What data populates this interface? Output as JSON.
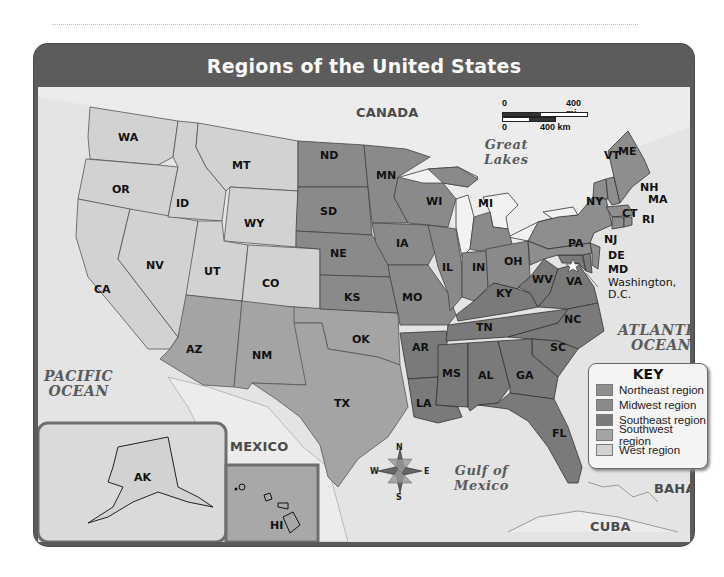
{
  "title": "Regions of the United States",
  "regions": {
    "northeast": {
      "label": "Northeast region",
      "color": "#8e8e8e",
      "states": [
        "ME",
        "VT",
        "NH",
        "MA",
        "RI",
        "CT",
        "NY",
        "PA",
        "NJ"
      ]
    },
    "midwest": {
      "label": "Midwest region",
      "color": "#8a8a8a",
      "states": [
        "ND",
        "SD",
        "NE",
        "KS",
        "MN",
        "IA",
        "MO",
        "WI",
        "IL",
        "MI",
        "IN",
        "OH"
      ]
    },
    "southeast": {
      "label": "Southeast region",
      "color": "#7a7a7a",
      "states": [
        "AR",
        "LA",
        "MS",
        "AL",
        "TN",
        "KY",
        "WV",
        "VA",
        "NC",
        "SC",
        "GA",
        "FL",
        "DE",
        "MD"
      ]
    },
    "southwest": {
      "label": "Southwest region",
      "color": "#a4a4a4",
      "states": [
        "AZ",
        "NM",
        "OK",
        "TX"
      ]
    },
    "west": {
      "label": "West region",
      "color": "#d2d2d2",
      "states": [
        "WA",
        "OR",
        "CA",
        "NV",
        "ID",
        "MT",
        "WY",
        "UT",
        "CO",
        "AK",
        "HI"
      ]
    }
  },
  "key": {
    "title": "KEY",
    "items": [
      {
        "label": "Northeast region",
        "color": "#8e8e8e"
      },
      {
        "label": "Midwest region",
        "color": "#8a8a8a"
      },
      {
        "label": "Southeast region",
        "color": "#7a7a7a"
      },
      {
        "label": "Southwest region",
        "color": "#a4a4a4"
      },
      {
        "label": "West region",
        "color": "#d2d2d2"
      }
    ]
  },
  "scale_bar": {
    "miles_zero": "0",
    "miles_label": "400 mi",
    "km_zero": "0",
    "km_label": "400 km"
  },
  "compass": {
    "n": "N",
    "s": "S",
    "e": "E",
    "w": "W"
  },
  "water_labels": {
    "pacific": "PACIFIC OCEAN",
    "pacific_line1": "PACIFIC",
    "pacific_line2": "OCEAN",
    "atlantic_line1": "ATLANTIC",
    "atlantic_line2": "OCEAN",
    "great_lakes_line1": "Great",
    "great_lakes_line2": "Lakes",
    "gulf_line1": "Gulf of",
    "gulf_line2": "Mexico"
  },
  "country_labels": {
    "canada": "CANADA",
    "mexico": "MEXICO",
    "bahamas": "BAHAMAS",
    "cuba": "CUBA"
  },
  "capital": {
    "line1": "Washington,",
    "line2": "D.C."
  },
  "state_labels": {
    "WA": "WA",
    "OR": "OR",
    "CA": "CA",
    "NV": "NV",
    "ID": "ID",
    "MT": "MT",
    "WY": "WY",
    "UT": "UT",
    "CO": "CO",
    "AZ": "AZ",
    "NM": "NM",
    "OK": "OK",
    "TX": "TX",
    "ND": "ND",
    "SD": "SD",
    "NE": "NE",
    "KS": "KS",
    "MN": "MN",
    "IA": "IA",
    "MO": "MO",
    "WI": "WI",
    "IL": "IL",
    "MI": "MI",
    "IN": "IN",
    "OH": "OH",
    "AR": "AR",
    "LA": "LA",
    "MS": "MS",
    "AL": "AL",
    "TN": "TN",
    "KY": "KY",
    "WV": "WV",
    "VA": "VA",
    "NC": "NC",
    "SC": "SC",
    "GA": "GA",
    "FL": "FL",
    "DE": "DE",
    "MD": "MD",
    "ME": "ME",
    "VT": "VT",
    "NH": "NH",
    "MA": "MA",
    "RI": "RI",
    "CT": "CT",
    "NY": "NY",
    "PA": "PA",
    "NJ": "NJ",
    "AK": "AK",
    "HI": "HI"
  }
}
